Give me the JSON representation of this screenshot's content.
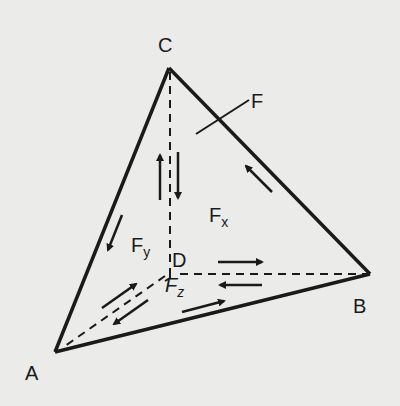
{
  "diagram": {
    "vertices": {
      "A": "A",
      "B": "B",
      "C": "C",
      "D": "D"
    },
    "forces": {
      "F": "F",
      "Fx": {
        "base": "F",
        "sub": "x"
      },
      "Fy": {
        "base": "F",
        "sub": "y"
      },
      "Fz": {
        "base": "F",
        "sub": "z"
      }
    },
    "colors": {
      "line": "#1a1a1a",
      "background": "#ebebea"
    }
  }
}
